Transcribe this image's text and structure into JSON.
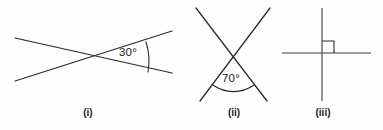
{
  "sheet": {
    "width": 383,
    "height": 130,
    "background_color": "#fefefe",
    "ink_color": "#2b2b2b"
  },
  "figures": [
    {
      "id": "figure-i",
      "caption": "(i)",
      "caption_x": 88,
      "caption_y": 116,
      "type": "two-intersecting-lines",
      "angle_label": "30°",
      "angle_value": 30,
      "angle_label_x": 119,
      "angle_label_y": 56,
      "vertex": {
        "x": 88,
        "y": 57
      },
      "lines": [
        {
          "name": "line-rising",
          "x1": 15,
          "y1": 81,
          "x2": 172,
          "y2": 31
        },
        {
          "name": "line-falling",
          "x1": 15,
          "y1": 38,
          "x2": 172,
          "y2": 73
        }
      ],
      "arc": {
        "name": "angle-arc-30",
        "path": "M 146 42 A 62 62 0 0 1 148 72",
        "radius": 62
      }
    },
    {
      "id": "figure-ii",
      "caption": "(ii)",
      "caption_x": 234,
      "caption_y": 116,
      "type": "two-intersecting-lines",
      "angle_label": "70°",
      "angle_value": 70,
      "angle_label_x": 222,
      "angle_label_y": 82,
      "vertex": {
        "x": 233,
        "y": 57
      },
      "lines": [
        {
          "name": "line-down-right",
          "x1": 196,
          "y1": 8,
          "x2": 267,
          "y2": 101
        },
        {
          "name": "line-down-left",
          "x1": 270,
          "y1": 8,
          "x2": 200,
          "y2": 101
        }
      ],
      "arc": {
        "name": "angle-arc-70",
        "path": "M 213 85 A 35 35 0 0 0 254 85",
        "radius": 35
      }
    },
    {
      "id": "figure-iii",
      "caption": "(iii)",
      "caption_x": 323,
      "caption_y": 116,
      "type": "perpendicular-lines",
      "angle_label": "",
      "angle_value": 90,
      "vertex": {
        "x": 322,
        "y": 53
      },
      "lines": [
        {
          "name": "vertical-line",
          "x1": 322,
          "y1": 8,
          "x2": 322,
          "y2": 101
        },
        {
          "name": "horizontal-line",
          "x1": 282,
          "y1": 53,
          "x2": 371,
          "y2": 53
        }
      ],
      "right_angle_mark": {
        "name": "right-angle-square",
        "path": "M 322 41 L 334 41 L 334 53",
        "size": 12
      }
    }
  ]
}
